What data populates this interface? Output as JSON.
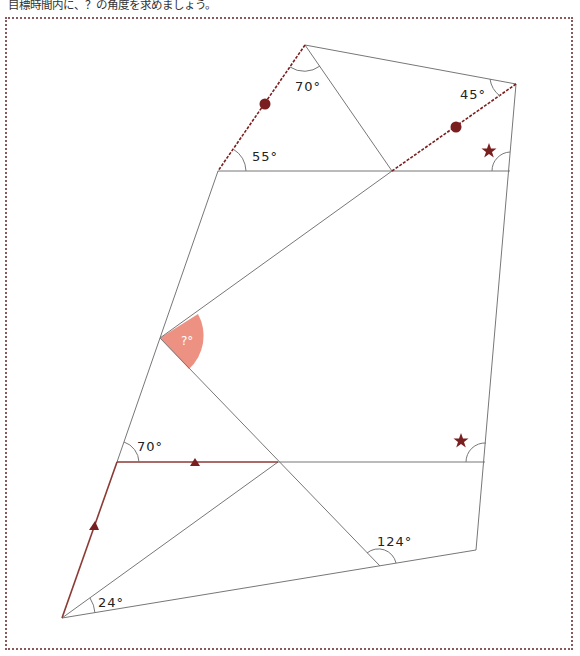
{
  "instruction": "目標時間内に、？の角度を求めましょう。",
  "figure": {
    "angles": {
      "top_apex": "70°",
      "upper_left": "55°",
      "upper_right": "45°",
      "unknown": "?°",
      "lower_left": "70°",
      "lower_right_mid": "124°",
      "bottom_left": "24°"
    },
    "markers": {
      "equal_segment_circle": "circle",
      "equal_angle_star": "star",
      "parallel_triangle": "triangle"
    },
    "colors": {
      "line": "#777777",
      "accent": "#7a1f1f",
      "unknown_fill": "#ec8c7c",
      "frame": "#8a5a5a"
    }
  }
}
